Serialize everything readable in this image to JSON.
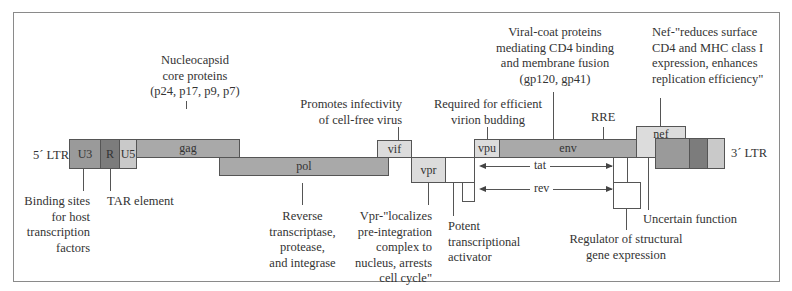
{
  "diagram": {
    "ltr_left": "5´ LTR",
    "ltr_right": "3´ LTR",
    "segments": {
      "u3": "U3",
      "r": "R",
      "u5": "U5",
      "gag": "gag",
      "pol": "pol",
      "vif": "vif",
      "vpr": "vpr",
      "vpu": "vpu",
      "env": "env",
      "nef": "nef",
      "tat": "tat",
      "rev": "rev",
      "rre": "RRE"
    },
    "annotations": {
      "gag": [
        "Nucleocapsid",
        "core proteins",
        "(p24, p17, p9, p7)"
      ],
      "vif": [
        "Promotes infectivity",
        "of cell-free virus"
      ],
      "vpu": [
        "Required for efficient",
        "virion budding"
      ],
      "env": [
        "Viral-coat proteins",
        "mediating CD4 binding",
        "and membrane fusion",
        "(gp120, gp41)"
      ],
      "nef": [
        "Nef-\"reduces surface",
        "CD4 and MHC class I",
        "expression, enhances",
        "replication efficiency\""
      ],
      "u3": [
        "Binding sites",
        "for host",
        "transcription",
        "factors"
      ],
      "r": [
        "TAR element"
      ],
      "pol": [
        "Reverse",
        "transcriptase,",
        "protease,",
        "and integrase"
      ],
      "vpr": [
        "Vpr-\"localizes",
        "pre-integration",
        "complex to",
        "nucleus, arrests",
        "cell cycle\""
      ],
      "tat": [
        "Potent",
        "transcriptional",
        "activator"
      ],
      "rev": [
        "Regulator of structural",
        "gene expression"
      ],
      "nef_lower": [
        "Uncertain function"
      ]
    }
  }
}
